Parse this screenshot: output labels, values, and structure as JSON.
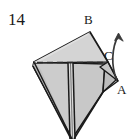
{
  "figure": {
    "item_number": "14",
    "type": "origami-folding-diagram",
    "vertex_labels": [
      {
        "id": "label-b",
        "text": "B",
        "x": 84,
        "y": 13
      },
      {
        "id": "label-c",
        "text": "C",
        "x": 104,
        "y": 49
      },
      {
        "id": "label-a",
        "text": "A",
        "x": 117,
        "y": 83
      }
    ],
    "colors": {
      "paper_light": "#d6d6d6",
      "paper_mid": "#c2c2c2",
      "paper_dark": "#b0b0b0",
      "paper_highlight": "#e2e2e2",
      "outline": "#1a1a1a",
      "dashed_fold": "#2a2a2a",
      "background": "#ffffff",
      "text": "#1a1a1a"
    },
    "geometry": {
      "apex_top_b": [
        90,
        32
      ],
      "vertex_left": [
        34,
        62
      ],
      "vertex_right": [
        108,
        62
      ],
      "vertex_a": [
        118,
        81
      ],
      "bottom_tip": [
        72,
        139
      ],
      "fold_line_start": [
        36,
        62
      ],
      "fold_line_end": [
        107,
        62
      ],
      "center_ridge_top": [
        70,
        63
      ]
    },
    "arrow": {
      "name": "rotation-arrow",
      "from": [
        116,
        78
      ],
      "to": [
        120,
        32
      ],
      "direction": "upward-curved",
      "meaning": "fold flap up about A"
    }
  }
}
